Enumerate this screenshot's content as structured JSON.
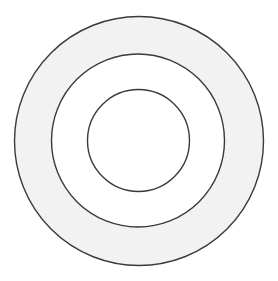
{
  "diagram": {
    "type": "concentric-circles",
    "background": "#ffffff",
    "stroke_color": "#3a3a3a",
    "stroke_width": 1.4,
    "circles": [
      {
        "name": "outer",
        "cx": 139,
        "cy": 141,
        "r": 124.5,
        "fill": "#f2f2f2"
      },
      {
        "name": "middle",
        "cx": 138,
        "cy": 140.5,
        "r": 86.5,
        "fill": "#ffffff"
      },
      {
        "name": "inner",
        "cx": 138.5,
        "cy": 140.5,
        "r": 51,
        "fill": "#ffffff"
      }
    ]
  }
}
